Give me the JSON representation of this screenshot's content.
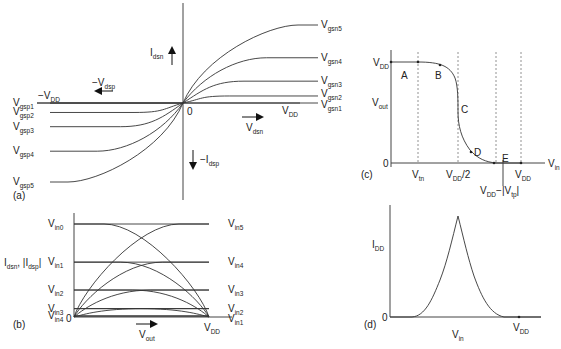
{
  "figure": {
    "panels": [
      {
        "id": "a",
        "tag": "(a)",
        "y_axis_label_main": "I",
        "y_axis_label_sub": "dsn",
        "neg_y_label_main": "−I",
        "neg_y_label_sub": "dsp",
        "x_axis_label_main": "V",
        "x_axis_label_sub": "dsn",
        "neg_x_label_main": "−V",
        "neg_x_label_sub": "dsp",
        "origin_label": "0",
        "vdd_main": "V",
        "vdd_sub": "DD",
        "neg_vdd_main": "−V",
        "neg_vdd_sub": "DD",
        "nmos_curves": [
          {
            "main": "V",
            "sub": "gsn5",
            "level": 1.0
          },
          {
            "main": "V",
            "sub": "gsn4",
            "level": 0.58
          },
          {
            "main": "V",
            "sub": "gsn3",
            "level": 0.28
          },
          {
            "main": "V",
            "sub": "gsn2",
            "level": 0.09
          },
          {
            "main": "V",
            "sub": "gsn1",
            "level": 0.0
          }
        ],
        "pmos_curves": [
          {
            "main": "V",
            "sub": "gsp1",
            "level": 0.0
          },
          {
            "main": "V",
            "sub": "gsp2",
            "level": 0.12
          },
          {
            "main": "V",
            "sub": "gsp3",
            "level": 0.3
          },
          {
            "main": "V",
            "sub": "gsp4",
            "level": 0.61
          },
          {
            "main": "V",
            "sub": "gsp5",
            "level": 1.0
          }
        ]
      },
      {
        "id": "b",
        "tag": "(b)",
        "y_axis_label": "I",
        "y_axis_sub": "dsn",
        "y_axis_label2": ", |I",
        "y_axis_sub2": "dsp",
        "y_axis_label3": "|",
        "x_axis_label_main": "V",
        "x_axis_label_sub": "out",
        "origin_label": "0",
        "vdd_main": "V",
        "vdd_sub": "DD",
        "left_labels": [
          {
            "main": "V",
            "sub": "in0",
            "level": 1.0
          },
          {
            "main": "V",
            "sub": "in1",
            "level": 0.59
          },
          {
            "main": "V",
            "sub": "in2",
            "level": 0.29
          },
          {
            "main": "V",
            "sub": "in3",
            "level": 0.09
          },
          {
            "main": "V",
            "sub": "in4",
            "level": 0.0
          }
        ],
        "right_labels": [
          {
            "main": "V",
            "sub": "in5",
            "level": 1.0
          },
          {
            "main": "V",
            "sub": "in4",
            "level": 0.59
          },
          {
            "main": "V",
            "sub": "in3",
            "level": 0.29
          },
          {
            "main": "V",
            "sub": "in2",
            "level": 0.09
          },
          {
            "main": "V",
            "sub": "in1",
            "level": 0.0
          }
        ]
      },
      {
        "id": "c",
        "tag": "(c)",
        "y_axis_label_main": "V",
        "y_axis_label_sub": "out",
        "x_axis_label_main": "V",
        "x_axis_label_sub": "in",
        "y_top_main": "V",
        "y_top_sub": "DD",
        "origin_label": "0",
        "x_ticks": [
          {
            "main": "V",
            "sub": "tn",
            "tail": ""
          },
          {
            "main": "V",
            "sub": "DD",
            "tail": "/2"
          },
          {
            "main": "V",
            "sub": "DD",
            "tail": "−|V",
            "sub2": "tp",
            "tail2": "|"
          },
          {
            "main": "V",
            "sub": "DD",
            "tail": ""
          }
        ],
        "regions": [
          "A",
          "B",
          "C",
          "D",
          "E"
        ]
      },
      {
        "id": "d",
        "tag": "(d)",
        "y_axis_label_main": "I",
        "y_axis_label_sub": "DD",
        "x_axis_label_main": "V",
        "x_axis_label_sub": "in",
        "origin_label": "0",
        "vdd_main": "V",
        "vdd_sub": "DD"
      }
    ]
  }
}
